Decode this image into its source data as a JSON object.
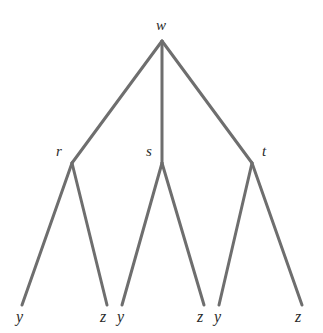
{
  "figure": {
    "type": "tree-diagram",
    "background_color": "#ffffff",
    "edge_color": "#6e6e6e",
    "edge_width": 3,
    "label_color": "#2b2b2b",
    "width": 323,
    "height": 333
  },
  "nodes": {
    "root": {
      "id": "w",
      "label": "w",
      "x": 162,
      "y": 41,
      "label_x": 156,
      "label_y": 18
    },
    "internal": [
      {
        "id": "r",
        "label": "r",
        "x": 72,
        "y": 163,
        "label_x": 56,
        "label_y": 144
      },
      {
        "id": "s",
        "label": "s",
        "x": 162,
        "y": 163,
        "label_x": 146,
        "label_y": 144
      },
      {
        "id": "t",
        "label": "t",
        "x": 252,
        "y": 163,
        "label_x": 262,
        "label_y": 144
      }
    ],
    "leaves": [
      {
        "id": "leaf1",
        "label": "y",
        "x": 22,
        "y": 305,
        "label_x": 16,
        "label_y": 309
      },
      {
        "id": "leaf2",
        "label": "z",
        "x": 107,
        "y": 305,
        "label_x": 100,
        "label_y": 309
      },
      {
        "id": "leaf3",
        "label": "y",
        "x": 122,
        "y": 305,
        "label_x": 117,
        "label_y": 309
      },
      {
        "id": "leaf4",
        "label": "z",
        "x": 204,
        "y": 305,
        "label_x": 197,
        "label_y": 309
      },
      {
        "id": "leaf5",
        "label": "y",
        "x": 219,
        "y": 305,
        "label_x": 214,
        "label_y": 309
      },
      {
        "id": "leaf6",
        "label": "z",
        "x": 302,
        "y": 305,
        "label_x": 295,
        "label_y": 309
      }
    ]
  },
  "edges": [
    {
      "id": "w-r",
      "from": "w",
      "to": "r",
      "x1": 162,
      "y1": 41,
      "x2": 72,
      "y2": 163
    },
    {
      "id": "w-s",
      "from": "w",
      "to": "s",
      "x1": 162,
      "y1": 41,
      "x2": 162,
      "y2": 163
    },
    {
      "id": "w-t",
      "from": "w",
      "to": "t",
      "x1": 162,
      "y1": 41,
      "x2": 252,
      "y2": 163
    },
    {
      "id": "r-y",
      "from": "r",
      "to": "leaf1",
      "x1": 72,
      "y1": 163,
      "x2": 22,
      "y2": 305
    },
    {
      "id": "r-z",
      "from": "r",
      "to": "leaf2",
      "x1": 72,
      "y1": 163,
      "x2": 107,
      "y2": 305
    },
    {
      "id": "s-y",
      "from": "s",
      "to": "leaf3",
      "x1": 162,
      "y1": 163,
      "x2": 122,
      "y2": 305
    },
    {
      "id": "s-z",
      "from": "s",
      "to": "leaf4",
      "x1": 162,
      "y1": 163,
      "x2": 204,
      "y2": 305
    },
    {
      "id": "t-y",
      "from": "t",
      "to": "leaf5",
      "x1": 252,
      "y1": 163,
      "x2": 219,
      "y2": 305
    },
    {
      "id": "t-z",
      "from": "t",
      "to": "leaf6",
      "x1": 252,
      "y1": 163,
      "x2": 302,
      "y2": 305
    }
  ]
}
